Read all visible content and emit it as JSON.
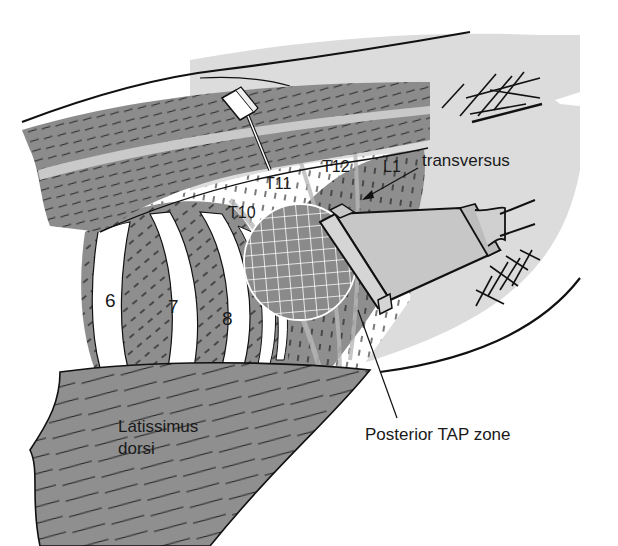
{
  "figure": {
    "type": "anatomical illustration",
    "colors": {
      "background": "#ffffff",
      "skin": "#dcdcdc",
      "muscle_dark": "#8a8a8a",
      "muscle_mid": "#9a9a9a",
      "rib_white": "#ffffff",
      "outline": "#111111",
      "probe": "#c8c8c8",
      "fascia_light": "#b8b8b8"
    }
  },
  "labels": {
    "transversus": "transversus",
    "posterior_tap_zone": "Posterior TAP zone",
    "latissimus_line1": "Latissimus",
    "latissimus_line2": "dorsi"
  },
  "segment_labels": {
    "t10": "T10",
    "t11": "T11",
    "t12": "T12",
    "l1": "L1"
  },
  "rib_numbers": {
    "rib6": "6",
    "rib7": "7",
    "rib8": "8"
  }
}
